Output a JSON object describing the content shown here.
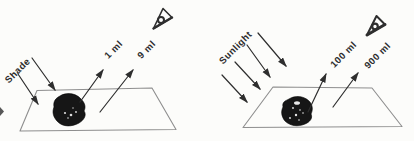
{
  "colors": {
    "background": "#fcfcfa",
    "ink": "#2e2e2e",
    "plane_outline": "#8e8e8e",
    "rock": "#161616"
  },
  "panels": [
    {
      "light_source_label": "Shade",
      "volume_labels": [
        "1 ml",
        "9 ml"
      ],
      "observer_icon": "eye-icon"
    },
    {
      "light_source_label": "Sunlight",
      "volume_labels": [
        "100 ml",
        "900 ml"
      ],
      "observer_icon": "eye-icon"
    }
  ]
}
